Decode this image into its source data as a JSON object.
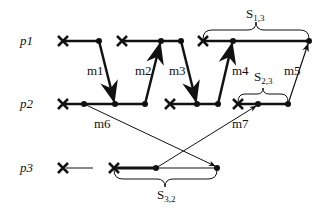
{
  "processes": [
    {
      "id": "p1",
      "label": "p1",
      "y": 41
    },
    {
      "id": "p2",
      "label": "p2",
      "y": 104
    },
    {
      "id": "p3",
      "label": "p3",
      "y": 168
    }
  ],
  "messages": [
    {
      "id": "m1",
      "label": "m1"
    },
    {
      "id": "m2",
      "label": "m2"
    },
    {
      "id": "m3",
      "label": "m3"
    },
    {
      "id": "m4",
      "label": "m4"
    },
    {
      "id": "m5",
      "label": "m5"
    },
    {
      "id": "m6",
      "label": "m6"
    },
    {
      "id": "m7",
      "label": "m7"
    }
  ],
  "braces": [
    {
      "id": "S13",
      "main": "S",
      "sub": "1,3"
    },
    {
      "id": "S23",
      "main": "S",
      "sub": "2,3"
    },
    {
      "id": "S32",
      "main": "S",
      "sub": "3,2"
    }
  ]
}
